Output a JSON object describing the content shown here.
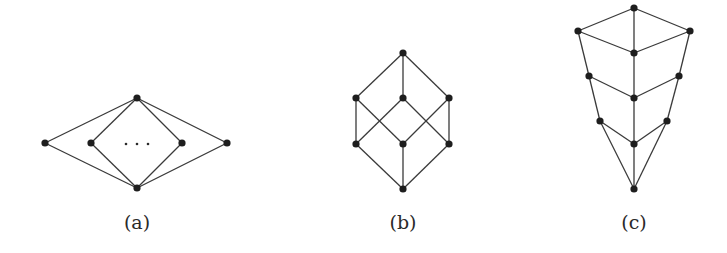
{
  "figure": {
    "panels": [
      {
        "id": "a",
        "caption": "(a)",
        "description": "Lattice with top and bottom element and a row of pairwise incomparable atoms, with ellipsis indicating more elements",
        "nodes": [
          "top",
          "atom-1",
          "atom-2",
          "atom-n-1",
          "atom-n",
          "bottom"
        ],
        "edges": [
          [
            "top",
            "atom-1"
          ],
          [
            "top",
            "atom-2"
          ],
          [
            "top",
            "atom-n-1"
          ],
          [
            "top",
            "atom-n"
          ],
          [
            "atom-1",
            "bottom"
          ],
          [
            "atom-2",
            "bottom"
          ],
          [
            "atom-n-1",
            "bottom"
          ],
          [
            "atom-n",
            "bottom"
          ]
        ],
        "ellipsis": "..."
      },
      {
        "id": "b",
        "caption": "(b)",
        "description": "Boolean lattice 2^3 (cube)",
        "nodes": [
          "top",
          "m-left",
          "m-center",
          "m-right",
          "l-left",
          "l-center",
          "l-right",
          "bottom"
        ],
        "edges": [
          [
            "top",
            "m-left"
          ],
          [
            "top",
            "m-center"
          ],
          [
            "top",
            "m-right"
          ],
          [
            "m-left",
            "l-left"
          ],
          [
            "m-left",
            "l-center"
          ],
          [
            "m-center",
            "l-left"
          ],
          [
            "m-center",
            "l-right"
          ],
          [
            "m-right",
            "l-center"
          ],
          [
            "m-right",
            "l-right"
          ],
          [
            "l-left",
            "bottom"
          ],
          [
            "l-center",
            "bottom"
          ],
          [
            "l-right",
            "bottom"
          ]
        ]
      },
      {
        "id": "c",
        "caption": "(c)",
        "description": "Lattice with three chains converging to bottom, connected by rungs to a central chain",
        "nodes": [
          "top",
          "r1-left",
          "r1-center",
          "r1-right",
          "r2-left",
          "r2-center",
          "r2-right",
          "r3-left",
          "r3-center",
          "r3-right",
          "bottom"
        ],
        "edges": [
          [
            "top",
            "r1-left"
          ],
          [
            "top",
            "r1-right"
          ],
          [
            "top",
            "r1-center"
          ],
          [
            "r1-left",
            "r1-center"
          ],
          [
            "r1-right",
            "r1-center"
          ],
          [
            "r1-left",
            "r2-left"
          ],
          [
            "r2-left",
            "r3-left"
          ],
          [
            "r3-left",
            "bottom"
          ],
          [
            "r1-right",
            "r2-right"
          ],
          [
            "r2-right",
            "r3-right"
          ],
          [
            "r3-right",
            "bottom"
          ],
          [
            "r1-center",
            "r2-center"
          ],
          [
            "r2-center",
            "r3-center"
          ],
          [
            "r3-center",
            "bottom"
          ],
          [
            "r2-left",
            "r2-center"
          ],
          [
            "r2-right",
            "r2-center"
          ],
          [
            "r3-left",
            "r3-center"
          ],
          [
            "r3-right",
            "r3-center"
          ]
        ]
      }
    ]
  }
}
